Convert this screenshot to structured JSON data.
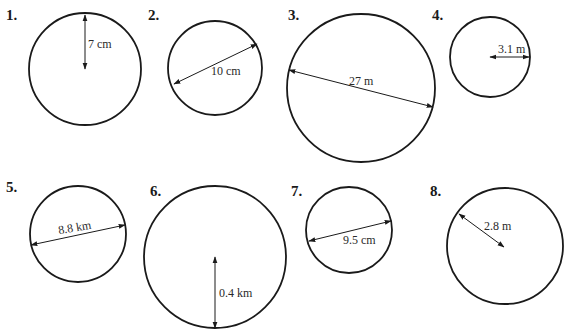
{
  "problems": [
    {
      "number": "1.",
      "label": "7 cm",
      "measure": "radius",
      "value": 7,
      "unit": "cm"
    },
    {
      "number": "2.",
      "label": "10 cm",
      "measure": "diameter",
      "value": 10,
      "unit": "cm"
    },
    {
      "number": "3.",
      "label": "27 m",
      "measure": "diameter",
      "value": 27,
      "unit": "m"
    },
    {
      "number": "4.",
      "label": "3.1 m",
      "measure": "radius",
      "value": 3.1,
      "unit": "m"
    },
    {
      "number": "5.",
      "label": "8.8 km",
      "measure": "diameter",
      "value": 8.8,
      "unit": "km"
    },
    {
      "number": "6.",
      "label": "0.4 km",
      "measure": "radius",
      "value": 0.4,
      "unit": "km"
    },
    {
      "number": "7.",
      "label": "9.5 cm",
      "measure": "diameter",
      "value": 9.5,
      "unit": "cm"
    },
    {
      "number": "8.",
      "label": "2.8 m",
      "measure": "radius",
      "value": 2.8,
      "unit": "m"
    }
  ],
  "colors": {
    "stroke": "#1a1a1a",
    "background": "#ffffff"
  }
}
